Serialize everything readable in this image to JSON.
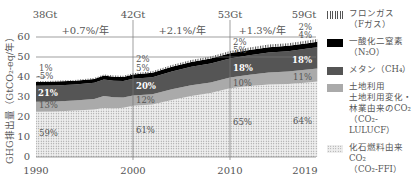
{
  "chart_data": {
    "type": "area",
    "stacked": true,
    "title": "",
    "xlabel": "",
    "ylabel": "GHG排出量（GtCO₂-eq/年）",
    "ylim": [
      0,
      65
    ],
    "yticks": [
      0,
      10,
      20,
      30,
      40,
      50,
      60
    ],
    "xticks": [
      "1990",
      "2000",
      "2010",
      "2019"
    ],
    "grid": "horizontal lines at 50 and 60; vertical lines at 2000 and 2010",
    "legend_position": "right",
    "x": [
      1990,
      1992,
      1994,
      1996,
      1997,
      1998,
      1999,
      2000,
      2002,
      2004,
      2006,
      2008,
      2010,
      2012,
      2014,
      2016,
      2018,
      2019
    ],
    "series": [
      {
        "name": "化石燃料由来CO₂ (CO₂-FFI)",
        "values": [
          22.6,
          22.8,
          23.2,
          23.8,
          24.5,
          24.3,
          24.6,
          25.6,
          26.2,
          28.5,
          30.5,
          32.0,
          34.4,
          35.5,
          36.3,
          36.5,
          37.2,
          37.8
        ]
      },
      {
        "name": "土地利用 土地利用変化・林業由来のCO₂ (CO₂-LULUCF)",
        "values": [
          5.0,
          5.0,
          5.0,
          5.2,
          6.0,
          5.6,
          5.2,
          5.1,
          5.2,
          5.4,
          5.4,
          5.3,
          5.3,
          5.6,
          6.0,
          6.2,
          6.5,
          6.5
        ]
      },
      {
        "name": "メタン (CH₄)",
        "values": [
          8.0,
          8.0,
          8.0,
          8.1,
          8.2,
          8.2,
          8.2,
          8.4,
          8.5,
          8.9,
          9.2,
          9.4,
          9.6,
          9.8,
          10.0,
          10.2,
          10.5,
          10.6
        ]
      },
      {
        "name": "一酸化二窒素 (N₂O)",
        "values": [
          1.9,
          1.9,
          1.9,
          1.9,
          2.0,
          2.0,
          2.0,
          2.1,
          2.2,
          2.3,
          2.4,
          2.5,
          2.6,
          2.6,
          2.6,
          2.7,
          2.7,
          2.7
        ]
      },
      {
        "name": "フロンガス (Fガス)",
        "values": [
          0.4,
          0.4,
          0.4,
          0.5,
          0.5,
          0.6,
          0.6,
          0.7,
          0.8,
          0.9,
          1.0,
          1.1,
          1.1,
          1.2,
          1.3,
          1.3,
          1.4,
          1.4
        ]
      }
    ],
    "totals_labels": [
      {
        "year": "1990",
        "label": "38Gt"
      },
      {
        "year": "2000",
        "label": "42Gt"
      },
      {
        "year": "2010",
        "label": "53Gt"
      },
      {
        "year": "2019",
        "label": "59Gt"
      }
    ],
    "growth_rates": [
      {
        "period": "1990-2000",
        "label": "+0.7%/年"
      },
      {
        "period": "2000-2010",
        "label": "+2.1%/年"
      },
      {
        "period": "2010-2019",
        "label": "+1.3%/年"
      }
    ],
    "share_labels": {
      "1990": {
        "fgas": "1%",
        "n2o": "5%",
        "ch4": "21%",
        "lulucf": "13%",
        "ffi": "59%"
      },
      "2000": {
        "fgas": "2%",
        "n2o": "5%",
        "ch4": "20%",
        "lulucf": "12%",
        "ffi": "61%"
      },
      "2010": {
        "fgas": "2%",
        "n2o": "5%",
        "ch4": "18%",
        "lulucf": "10%",
        "ffi": "65%"
      },
      "2019": {
        "fgas": "2%",
        "n2o": "4%",
        "ch4": "18%",
        "lulucf": "11%",
        "ffi": "64%"
      }
    }
  },
  "axis": {
    "ylabel": "GHG排出量（GtCO₂-eq/年）",
    "yticks": [
      "0",
      "10",
      "20",
      "30",
      "40",
      "50",
      "60"
    ],
    "xticks": [
      "1990",
      "2000",
      "2010",
      "2019"
    ]
  },
  "top": {
    "totals": [
      "38Gt",
      "42Gt",
      "53Gt",
      "59Gt"
    ],
    "rates": [
      "+0.7%/年",
      "+2.1%/年",
      "+1.3%/年"
    ]
  },
  "labels": {
    "y1990": {
      "fgas": "1%",
      "n2o": "-5%",
      "ch4": "21%",
      "lulucf": "13%",
      "ffi": "59%"
    },
    "y2000": {
      "fgas": "2%",
      "n2o": "5%",
      "ch4": "20%",
      "lulucf": "12%",
      "ffi": "61%"
    },
    "y2010": {
      "fgas": "2%",
      "n2o": "5%",
      "ch4": "18%",
      "lulucf": "10%",
      "ffi": "65%"
    },
    "y2019": {
      "fgas": "2%",
      "n2o": "4%",
      "ch4": "18%",
      "lulucf": "11%",
      "ffi": "64%"
    }
  },
  "legend": {
    "items": [
      {
        "key": "fgas",
        "label": "フロンガス\n（Fガス）"
      },
      {
        "key": "n2o",
        "label": "一酸化二窒素\n（N₂O）"
      },
      {
        "key": "ch4",
        "label": "メタン（CH₄）"
      },
      {
        "key": "lulucf",
        "label": "土地利用\n土地利用変化・\n林業由来のCO₂\n（CO₂-LULUCF）"
      },
      {
        "key": "ffi",
        "label": "化石燃料由来CO₂\n（CO₂-FFI）"
      }
    ]
  },
  "colors": {
    "ffi": "#e6e6e6",
    "lulucf": "#aaaaaa",
    "ch4": "#555555",
    "n2o": "#000000",
    "fgas": "#666666",
    "grid": "#777777"
  }
}
